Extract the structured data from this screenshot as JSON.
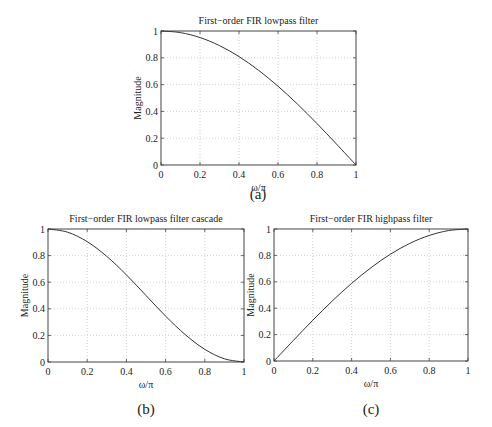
{
  "chart_data": [
    {
      "id": "a",
      "type": "line",
      "title": "First−order FIR lowpass filter",
      "xlabel": "ω/π",
      "ylabel": "Magnitude",
      "caption": "(a)",
      "xlim": [
        0,
        1
      ],
      "ylim": [
        0,
        1
      ],
      "xticks": [
        "0",
        "0.2",
        "0.4",
        "0.6",
        "0.8",
        "1"
      ],
      "yticks": [
        "0",
        "0.2",
        "0.4",
        "0.6",
        "0.8",
        "1"
      ],
      "grid": true,
      "x": [
        0,
        0.1,
        0.2,
        0.3,
        0.4,
        0.5,
        0.6,
        0.7,
        0.8,
        0.9,
        1.0
      ],
      "y": [
        1.0,
        0.988,
        0.951,
        0.891,
        0.809,
        0.707,
        0.588,
        0.454,
        0.309,
        0.156,
        0.0
      ],
      "frame": {
        "left": 161,
        "top": 31,
        "right": 356,
        "bottom": 165
      }
    },
    {
      "id": "b",
      "type": "line",
      "title": "First−order FIR lowpass filter cascade",
      "xlabel": "ω/π",
      "ylabel": "Magnitude",
      "caption": "(b)",
      "xlim": [
        0,
        1
      ],
      "ylim": [
        0,
        1
      ],
      "xticks": [
        "0",
        "0.2",
        "0.4",
        "0.6",
        "0.8",
        "1"
      ],
      "yticks": [
        "0",
        "0.2",
        "0.4",
        "0.6",
        "0.8",
        "1"
      ],
      "grid": true,
      "x": [
        0,
        0.1,
        0.2,
        0.3,
        0.4,
        0.5,
        0.6,
        0.7,
        0.8,
        0.9,
        1.0
      ],
      "y": [
        1.0,
        0.976,
        0.905,
        0.794,
        0.655,
        0.5,
        0.345,
        0.206,
        0.095,
        0.024,
        0.0
      ],
      "frame": {
        "left": 48,
        "top": 229,
        "right": 244,
        "bottom": 362
      }
    },
    {
      "id": "c",
      "type": "line",
      "title": "First−order FIR highpass filter",
      "xlabel": "ω/π",
      "ylabel": "Magnitude",
      "caption": "(c)",
      "xlim": [
        0,
        1
      ],
      "ylim": [
        0,
        1
      ],
      "xticks": [
        "0",
        "0.2",
        "0.4",
        "0.6",
        "0.8",
        "1"
      ],
      "yticks": [
        "0",
        "0.2",
        "0.4",
        "0.6",
        "0.8",
        "1"
      ],
      "grid": true,
      "x": [
        0,
        0.1,
        0.2,
        0.3,
        0.4,
        0.5,
        0.6,
        0.7,
        0.8,
        0.9,
        1.0
      ],
      "y": [
        0.0,
        0.156,
        0.309,
        0.454,
        0.588,
        0.707,
        0.809,
        0.891,
        0.951,
        0.988,
        1.0
      ],
      "frame": {
        "left": 274,
        "top": 229,
        "right": 468,
        "bottom": 361
      }
    }
  ],
  "captions": {
    "a": "(a)",
    "b": "(b)",
    "c": "(c)"
  },
  "colors": {
    "line": "#333333",
    "axis": "#444444",
    "grid": "#c8c8c8",
    "text": "#222222"
  }
}
